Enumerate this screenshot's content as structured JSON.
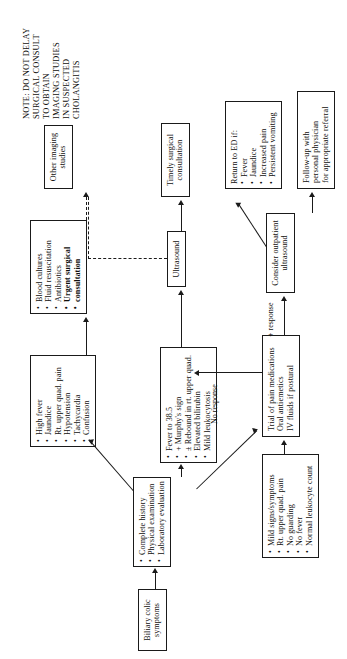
{
  "document": {
    "title": "Biliary colic evaluation and management algorithm",
    "orientation": "rotated-90-ccw"
  },
  "note": {
    "name": "cholangitis-warning-note",
    "lines": [
      "NOTE: DO NOT DELAY",
      "SURGICAL CONSULT",
      "TO OBTAIN",
      "IMAGING STUDIES",
      "IN SUSPECTED",
      "CHOLANGITIS"
    ]
  },
  "nodes": {
    "start": {
      "id": "start",
      "lines": [
        "Biliary colic",
        "symptoms"
      ]
    },
    "workup": {
      "id": "workup",
      "items": [
        "Complete history",
        "Physical examination",
        "Laboratory evaluation"
      ]
    },
    "severe_signs": {
      "id": "severe-signs",
      "items": [
        "High fever",
        "Jaundice",
        "Rt. upper quad. pain",
        "Hypotension",
        "Tachycardia",
        "Confusion"
      ]
    },
    "acute_cholecystitis": {
      "id": "acute-cholecystitis-findings",
      "items": [
        "Fever to 38.5",
        "+ Murphy's sign",
        "± Rebound in rt. upper quad.",
        "Elevated bilirubin",
        "Mild leukocytosis"
      ]
    },
    "mild_signs": {
      "id": "mild-signs",
      "items": [
        "Mild signs/symptoms",
        "Rt. upper quad. pain",
        "No guarding",
        "No fever",
        "Normal leukocyte count"
      ]
    },
    "cholangitis_treatment": {
      "id": "cholangitis-treatment",
      "items": [
        {
          "text": "Blood cultures",
          "bold": false
        },
        {
          "text": "Fluid resuscitation",
          "bold": false
        },
        {
          "text": "Antibiotics",
          "bold": false
        },
        {
          "text": "Urgent surgical",
          "bold": true
        },
        {
          "text": "consultation",
          "bold": true,
          "continuation": true
        }
      ]
    },
    "other_imaging": {
      "id": "other-imaging-studies",
      "lines": [
        "Other imaging",
        "studies"
      ]
    },
    "ultrasound": {
      "id": "ultrasound",
      "lines": [
        "Ultrasound"
      ]
    },
    "timely_surgical": {
      "id": "timely-surgical-consultation",
      "lines": [
        "Timely surgical",
        "consultation"
      ]
    },
    "pain_trial": {
      "id": "pain-medication-trial",
      "lines": [
        "Trial of pain medications",
        "Oral antiemetics",
        "IV fluids if postural"
      ]
    },
    "outpatient_us": {
      "id": "consider-outpatient-ultrasound",
      "lines": [
        "Consider outpatient",
        "ultrasound"
      ]
    },
    "return_ed": {
      "id": "return-to-ed",
      "header": "Return to ED if:",
      "items": [
        "Fever",
        "Jaundice",
        "Increased pain",
        "Persistent vomiting"
      ]
    },
    "followup": {
      "id": "follow-up",
      "lines": [
        "Follow-up with",
        "personal physician",
        "for appropriate referral"
      ]
    }
  },
  "edge_labels": {
    "no_response": "No response",
    "plus_response": "+ response"
  },
  "colors": {
    "ink": "#1a1a1a",
    "paper": "#ffffff"
  }
}
